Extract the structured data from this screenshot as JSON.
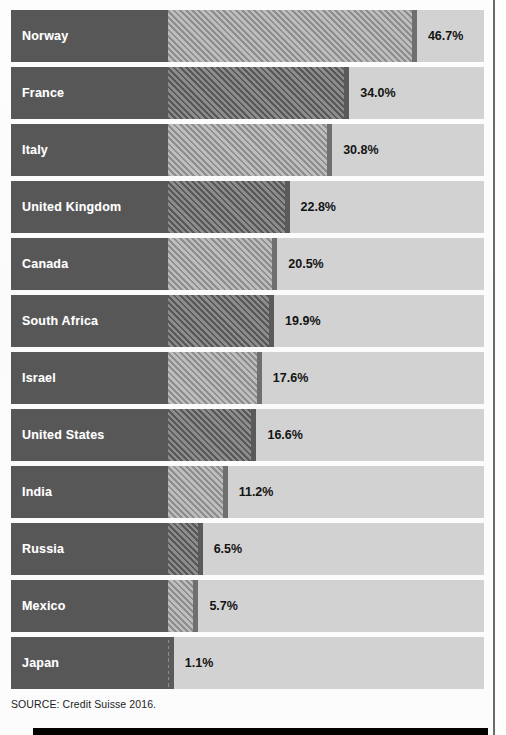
{
  "chart_data": {
    "type": "bar",
    "orientation": "horizontal",
    "title": "",
    "subtitle": "",
    "xlabel": "",
    "ylabel": "",
    "xlim": [
      0,
      88
    ],
    "grid": false,
    "legend": null,
    "unit": "%",
    "categories": [
      "Norway",
      "France",
      "Italy",
      "United Kingdom",
      "Canada",
      "South Africa",
      "Israel",
      "United States",
      "India",
      "Russia",
      "Mexico",
      "Japan"
    ],
    "values": [
      46.7,
      34.0,
      30.8,
      22.8,
      20.5,
      19.9,
      17.6,
      16.6,
      11.2,
      6.5,
      5.7,
      1.1
    ],
    "value_labels": [
      "46.7%",
      "34.0%",
      "30.8%",
      "22.8%",
      "20.5%",
      "19.9%",
      "17.6%",
      "16.6%",
      "11.2%",
      "6.5%",
      "5.7%",
      "1.1%"
    ],
    "bar_fills": [
      "hatch-light",
      "hatch-dark",
      "hatch-light",
      "hatch-dark",
      "hatch-light",
      "hatch-dark",
      "hatch-light",
      "hatch-dark",
      "hatch-light",
      "hatch-dark",
      "hatch-light",
      "hatch-dark"
    ]
  },
  "footer": {
    "source": "SOURCE: Credit Suisse 2016."
  },
  "colors": {
    "label_block": "#575757",
    "track": "#d2d2d2",
    "hatch_light": "#8e8e8e",
    "hatch_dark": "#5d5d5d",
    "value_text": "#141414",
    "label_text": "#ffffff",
    "footer_bar": "#000000",
    "page_rule": "#6b6b6b"
  }
}
